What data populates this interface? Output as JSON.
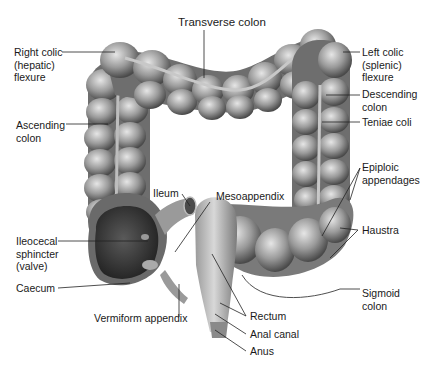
{
  "diagram": {
    "labels": {
      "transverse_colon": "Transverse colon",
      "right_colic_flexure": "Right colic\n(hepatic)\nflexure",
      "left_colic_flexure": "Left colic\n(splenic)\nflexure",
      "descending_colon": "Descending\ncolon",
      "teniae_coli": "Teniae coli",
      "ascending_colon": "Ascending\ncolon",
      "epiploic_appendages": "Epiploic\nappendages",
      "ileum": "Ileum",
      "mesoappendix": "Mesoappendix",
      "haustra": "Haustra",
      "ileocecal_sphincter": "Ileocecal\nsphincter\n(valve)",
      "caecum": "Caecum",
      "sigmoid_colon": "Sigmoid\ncolon",
      "rectum": "Rectum",
      "vermiform_appendix": "Vermiform appendix",
      "anal_canal": "Anal canal",
      "anus": "Anus"
    },
    "colors": {
      "background": "#ffffff",
      "tissue_light": "#c8c8c8",
      "tissue_mid": "#8a8a8a",
      "tissue_dark": "#3c3c3c",
      "leader_line": "#222222",
      "text": "#1a1a1a"
    }
  }
}
